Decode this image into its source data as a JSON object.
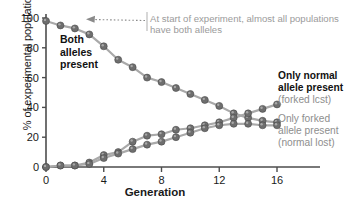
{
  "chart_data": {
    "type": "line",
    "title": "",
    "xlabel": "Generation",
    "ylabel": "% of experimental populations",
    "xlim": [
      0,
      17.2
    ],
    "ylim": [
      0,
      100
    ],
    "xticks": [
      0,
      4,
      8,
      12,
      16
    ],
    "yticks": [
      0,
      20,
      40,
      60,
      80,
      100
    ],
    "grid": false,
    "legend": "none",
    "x": [
      0,
      1,
      2,
      3,
      4,
      5,
      6,
      7,
      8,
      9,
      10,
      11,
      12,
      13,
      14,
      15,
      16
    ],
    "series": [
      {
        "name": "Both alleles present",
        "values": [
          98,
          95,
          93,
          89,
          81,
          72,
          67,
          60,
          57,
          53,
          49,
          45,
          41,
          36,
          33,
          31,
          30
        ]
      },
      {
        "name": "Only normal allele present (forked lost)",
        "values": [
          0,
          1,
          1,
          3,
          8,
          10,
          17,
          21,
          22,
          25,
          26,
          28,
          30,
          33,
          36,
          39,
          42
        ]
      },
      {
        "name": "Only forked allele present (normal lost)",
        "values": [
          0,
          1,
          1,
          2,
          6,
          9,
          12,
          15,
          17,
          20,
          23,
          26,
          28,
          29,
          29,
          28,
          28
        ]
      }
    ],
    "annotations": [
      {
        "name": "start-note",
        "text": "At start of experiment, almost all populations have both alleles"
      },
      {
        "name": "both-alleles-label",
        "lines": [
          "Both",
          "alleles",
          "present"
        ]
      },
      {
        "name": "normal-only-label",
        "bold": [
          "Only normal",
          "allele present"
        ],
        "sub": "(forked lcst)"
      },
      {
        "name": "forked-only-label",
        "bold": [
          "Only forked"
        ],
        "grey": [
          "allele present",
          "(normal lost)"
        ],
        "head": "Only forked"
      }
    ],
    "colors": {
      "marker": "#6e6e6e",
      "line": "#a9a9a9",
      "axis": "#4d4d4d",
      "annotation": "#9b9b9b",
      "text": "#1a1a1a"
    }
  },
  "axis": {
    "xlabel": "Generation",
    "ylabel": "% of experimental populations",
    "xticks": [
      "0",
      "4",
      "8",
      "12",
      "16"
    ],
    "yticks": [
      "0",
      "20",
      "40",
      "60",
      "80",
      "100"
    ]
  },
  "labels": {
    "start_note": "At start of experiment, almost all populations have both alleles",
    "both_1": "Both",
    "both_2": "alleles",
    "both_3": "present",
    "normal_1": "Only normal",
    "normal_2": "allele present",
    "normal_3": "(forked lcst)",
    "forked_1": "Only forked",
    "forked_2": "allele present",
    "forked_3": "(normal lost)"
  }
}
